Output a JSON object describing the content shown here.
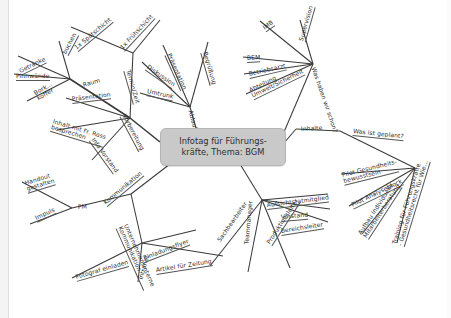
{
  "document": {
    "type": "mind-map",
    "background_color": "#ffffff",
    "line_color": "#3a3a3a",
    "node_fill": "#c9c9c9",
    "node_border": "#b4b4b4"
  },
  "center": {
    "label": "Infotag für Führungs-\nkräfte, Thema: BGM"
  },
  "branches": {
    "vorbereitung": {
      "label": "Vorbereitung",
      "children": {
        "raum": {
          "label": "Raum",
          "children": [
            "Getränke",
            "buchen",
            "Pinnwände",
            "Bork...\nkoffer"
          ]
        },
        "termin": {
          "label": "Termin/Zeit",
          "children": [
            "1x Spätschicht",
            "1x Frühschicht"
          ]
        },
        "praesentation": {
          "label": "Präsentation"
        },
        "inhalt": {
          "label": "Inhalt mit Fr. Ross\nbesprechen"
        },
        "info_vorstand": {
          "label": "Info Vorstand"
        }
      }
    },
    "ablauf": {
      "label": "Ablauf",
      "children": [
        "Präsentation",
        "Diskussion",
        "Umtrunk",
        "Begrüßung"
      ]
    },
    "was_haben_wir_schon": {
      "label": "Was haben wir schon?",
      "children": [
        "IMB",
        "BEM",
        "Betriebsarzt",
        "Abteilung\nUmwelt/Sicherheit",
        "Supervision"
      ]
    },
    "inhalte": {
      "label": "Inhalte"
    },
    "was_ist_geplant": {
      "label": "Was ist geplant?",
      "children": [
        "Pilot Gesundheits-\nbewusstsein",
        "Pilot Analyseblock",
        "Aufbau individuelle\nMitarbeiterberatung",
        "Training für Führungskräfte\n- Gesundheitsrecht für Wie..."
      ]
    },
    "zielgruppen": {
      "label": "",
      "children": [
        "Aufsichtsratmitglied",
        "Vorstand",
        "Bereichsleiter",
        "Produktionsleiter",
        "Teammanager",
        "Sachbearbeiter"
      ]
    },
    "kommunikation": {
      "label": "Kommunikation",
      "children": {
        "pm": {
          "label": "PM",
          "children": [
            "Handout\ngestalten",
            "Impuls"
          ]
        },
        "unternehmensinterne": {
          "label": "Unternehmensinterne\nKommunikation",
          "children": [
            "Fotograf einladen",
            "Intranet",
            "Einladungsflyer",
            "Artikel für Zeitung"
          ]
        }
      }
    }
  },
  "labels": [
    {
      "id": "getraenke",
      "text": "Getränke",
      "x": 20,
      "y": 68,
      "rot": -26,
      "ul": true
    },
    {
      "id": "buchen",
      "text": "buchen",
      "x": 65,
      "y": 50,
      "rot": -62,
      "ul": true
    },
    {
      "id": "pinnwaende",
      "text": "Pinnwände",
      "x": 16,
      "y": 73,
      "rot": 0,
      "ul": true
    },
    {
      "id": "borkkoffer",
      "text": "Bork...\nkoffer",
      "x": 36,
      "y": 90,
      "rot": -30,
      "ul": false
    },
    {
      "id": "spaetschicht",
      "text": "1x Spätschicht",
      "x": 76,
      "y": 45,
      "rot": -40,
      "ul": true
    },
    {
      "id": "fruehschicht",
      "text": "1x Frühschicht",
      "x": 122,
      "y": 45,
      "rot": -47,
      "ul": true
    },
    {
      "id": "terminzeit",
      "text": "Termin/Zeit",
      "x": 127,
      "y": 66,
      "rot": 74,
      "ul": true
    },
    {
      "id": "raum",
      "text": "Raum",
      "x": 83,
      "y": 82,
      "rot": -16,
      "ul": false
    },
    {
      "id": "praesentation1",
      "text": "Präsentation",
      "x": 72,
      "y": 96,
      "rot": -7,
      "ul": true
    },
    {
      "id": "inhaltross",
      "text": "Inhalt mit Fr. Ross\nbesprechen",
      "x": 52,
      "y": 118,
      "rot": 17,
      "ul": true
    },
    {
      "id": "infovorstand",
      "text": "Info Vorstand",
      "x": 92,
      "y": 135,
      "rot": 54,
      "ul": true
    },
    {
      "id": "vorbereitung",
      "text": "Vorbereitung",
      "x": 123,
      "y": 111,
      "rot": 62,
      "ul": true
    },
    {
      "id": "praesentation2",
      "text": "Präsentation",
      "x": 168,
      "y": 50,
      "rot": 66,
      "ul": true
    },
    {
      "id": "diskussion",
      "text": "Diskussion",
      "x": 147,
      "y": 63,
      "rot": 35,
      "ul": true
    },
    {
      "id": "umtrunk",
      "text": "Umtrunk",
      "x": 147,
      "y": 88,
      "rot": 12,
      "ul": true
    },
    {
      "id": "begruessung",
      "text": "Begrüßung",
      "x": 204,
      "y": 48,
      "rot": 74,
      "ul": true
    },
    {
      "id": "ablauf",
      "text": "Ablauf",
      "x": 190,
      "y": 107,
      "rot": 75,
      "ul": false
    },
    {
      "id": "imb",
      "text": "IMB",
      "x": 264,
      "y": 25,
      "rot": -35,
      "ul": true
    },
    {
      "id": "bem",
      "text": "BEM",
      "x": 247,
      "y": 55,
      "rot": -3,
      "ul": true
    },
    {
      "id": "betriebsarzt",
      "text": "Betriebsarzt",
      "x": 249,
      "y": 71,
      "rot": -13,
      "ul": true
    },
    {
      "id": "abtumwelt",
      "text": "Abteilung\nUmwelt/Sicherheit",
      "x": 251,
      "y": 87,
      "rot": -26,
      "ul": true
    },
    {
      "id": "supervision",
      "text": "Supervision",
      "x": 302,
      "y": 37,
      "rot": -74,
      "ul": true
    },
    {
      "id": "washabenwirschon",
      "text": "Was haben wir schon?",
      "x": 313,
      "y": 64,
      "rot": 71,
      "ul": false
    },
    {
      "id": "inhalte",
      "text": "Inhalte",
      "x": 301,
      "y": 126,
      "rot": -3,
      "ul": false
    },
    {
      "id": "wasistgeplant",
      "text": "Was ist geplant?",
      "x": 353,
      "y": 128,
      "rot": 6,
      "ul": true
    },
    {
      "id": "pilotgesundheit",
      "text": "Pilot Gesundheits-\nbewusstsein",
      "x": 343,
      "y": 172,
      "rot": -14,
      "ul": true
    },
    {
      "id": "pilotanalyse",
      "text": "Pilot Analyseblock",
      "x": 352,
      "y": 202,
      "rot": -26,
      "ul": true
    },
    {
      "id": "aufbauindiv",
      "text": "Aufbau individuelle\nMitarbeiterberatung",
      "x": 363,
      "y": 229,
      "rot": -57,
      "ul": true
    },
    {
      "id": "trainingfk",
      "text": "Training für Führungskräfte\n- Gesundheitsrecht für Wie...",
      "x": 398,
      "y": 238,
      "rot": -73,
      "ul": true
    },
    {
      "id": "aufsichtsrat",
      "text": "Aufsichtsratmitglied",
      "x": 267,
      "y": 202,
      "rot": -7,
      "ul": true
    },
    {
      "id": "vorstand",
      "text": "Vorstand",
      "x": 281,
      "y": 214,
      "rot": -5,
      "ul": true
    },
    {
      "id": "bereichsleiter",
      "text": "Bereichsleiter",
      "x": 281,
      "y": 228,
      "rot": -9,
      "ul": true
    },
    {
      "id": "produktionsleiter",
      "text": "Produktionsleiter",
      "x": 269,
      "y": 240,
      "rot": -57,
      "ul": true
    },
    {
      "id": "teammanager",
      "text": "Teammanager",
      "x": 247,
      "y": 241,
      "rot": -85,
      "ul": false
    },
    {
      "id": "sachbearbeiter",
      "text": "Sachbearbeiter",
      "x": 219,
      "y": 238,
      "rot": -55,
      "ul": false
    },
    {
      "id": "handout",
      "text": "Handout\ngestalten",
      "x": 26,
      "y": 180,
      "rot": -17,
      "ul": true
    },
    {
      "id": "impuls",
      "text": "Impuls",
      "x": 36,
      "y": 215,
      "rot": -25,
      "ul": true
    },
    {
      "id": "pm",
      "text": "PM",
      "x": 78,
      "y": 204,
      "rot": -3,
      "ul": false
    },
    {
      "id": "kommunikation",
      "text": "Kommunikation",
      "x": 105,
      "y": 200,
      "rot": -40,
      "ul": true
    },
    {
      "id": "unternehmensinterne",
      "text": "Unternehmensinterne\nKommunikation",
      "x": 122,
      "y": 219,
      "rot": 66,
      "ul": true
    },
    {
      "id": "fotograf",
      "text": "Fotograf einladen",
      "x": 76,
      "y": 274,
      "rot": -16,
      "ul": true
    },
    {
      "id": "intranet",
      "text": "Intranet",
      "x": 141,
      "y": 276,
      "rot": -75,
      "ul": false
    },
    {
      "id": "einladungsflyer",
      "text": "Einladungsflyer",
      "x": 144,
      "y": 255,
      "rot": -21,
      "ul": true
    },
    {
      "id": "artikelzeitung",
      "text": "Artikel für Zeitung",
      "x": 156,
      "y": 267,
      "rot": -9,
      "ul": true
    }
  ],
  "edges": [
    {
      "from": "center-left",
      "d": "M160,142 L130,118"
    },
    {
      "from": "vorbereitung-hub",
      "d": "M130,118 L70,79"
    },
    {
      "from": "raum-getraenke",
      "d": "M70,79 L18,56"
    },
    {
      "from": "raum-buchen",
      "d": "M70,79 L59,41"
    },
    {
      "from": "raum-pinnwaende",
      "d": "M70,79 L14,74"
    },
    {
      "from": "raum-bork",
      "d": "M70,79 L27,101"
    },
    {
      "from": "termin-hub",
      "d": "M130,118 L133,53"
    },
    {
      "from": "termin-spaet",
      "d": "M133,53 L71,27"
    },
    {
      "from": "termin-frueh",
      "d": "M133,53 L160,20"
    },
    {
      "from": "vorb-praes",
      "d": "M130,118 L66,98"
    },
    {
      "from": "vorb-inhalt",
      "d": "M130,118 L57,130"
    },
    {
      "from": "vorb-info",
      "d": "M130,118 L92,160"
    },
    {
      "from": "center-ablauf",
      "d": "M196,128 L190,107"
    },
    {
      "from": "ablauf-praes",
      "d": "M190,107 L163,45"
    },
    {
      "from": "ablauf-disk",
      "d": "M190,107 L142,62"
    },
    {
      "from": "ablauf-umtrunk",
      "d": "M190,107 L140,93"
    },
    {
      "from": "ablauf-begr",
      "d": "M190,107 L208,42"
    },
    {
      "from": "center-whws",
      "d": "M284,132 L313,64"
    },
    {
      "from": "whws-imb",
      "d": "M313,64 L260,21"
    },
    {
      "from": "whws-bem",
      "d": "M313,64 L243,57"
    },
    {
      "from": "whws-arzt",
      "d": "M313,64 L244,74"
    },
    {
      "from": "whws-abt",
      "d": "M313,64 L246,94"
    },
    {
      "from": "whws-super",
      "d": "M313,64 L300,20"
    },
    {
      "from": "center-inhalte",
      "d": "M284,143 L296,129"
    },
    {
      "from": "inhalte-geplant",
      "d": "M296,129 L340,131"
    },
    {
      "from": "geplant-hub",
      "d": "M340,131 L415,168"
    },
    {
      "from": "geplant-pilot1",
      "d": "M415,168 L341,174"
    },
    {
      "from": "geplant-pilot2",
      "d": "M415,168 L349,206"
    },
    {
      "from": "geplant-aufbau",
      "d": "M415,168 L362,234"
    },
    {
      "from": "geplant-training",
      "d": "M415,168 L397,243"
    },
    {
      "from": "center-zielgruppen",
      "d": "M240,164 L262,200"
    },
    {
      "from": "zg-aufsichtsrat",
      "d": "M262,200 L328,194"
    },
    {
      "from": "zg-vorstand",
      "d": "M262,200 L330,209"
    },
    {
      "from": "zg-bereich",
      "d": "M262,200 L328,222"
    },
    {
      "from": "zg-produktion",
      "d": "M262,200 L290,268"
    },
    {
      "from": "zg-teammanager",
      "d": "M262,200 L248,272"
    },
    {
      "from": "zg-sachbearb",
      "d": "M262,200 L210,266"
    },
    {
      "from": "center-komm",
      "d": "M170,164 L131,194"
    },
    {
      "from": "komm-pm",
      "d": "M131,194 L72,208"
    },
    {
      "from": "pm-handout",
      "d": "M72,208 L22,182"
    },
    {
      "from": "pm-impuls",
      "d": "M72,208 L30,224"
    },
    {
      "from": "komm-unt",
      "d": "M131,194 L142,243"
    },
    {
      "from": "unt-fotograf",
      "d": "M142,243 L72,278"
    },
    {
      "from": "unt-intranet",
      "d": "M142,243 L138,282"
    },
    {
      "from": "unt-flyer",
      "d": "M142,243 L196,230"
    },
    {
      "from": "unt-artikel",
      "d": "M142,243 L223,256"
    }
  ]
}
